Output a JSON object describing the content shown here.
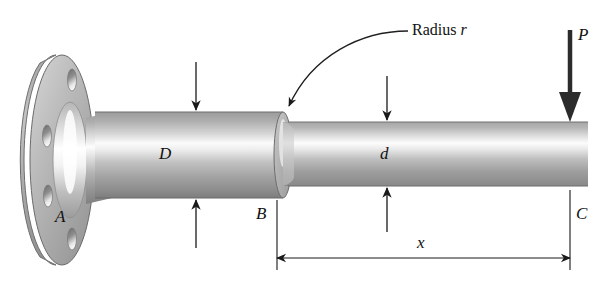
{
  "figure": {
    "background_color": "#ffffff",
    "line_color": "#1a1a1a",
    "metal_light": "#ffffff",
    "metal_mid": "#b9b9b9",
    "metal_dark": "#8d8d8d",
    "metal_shadow": "#6f6f6f"
  },
  "labels": {
    "point_a": "A",
    "point_b": "B",
    "point_c": "C",
    "large_diameter": "D",
    "small_diameter": "d",
    "load": "P",
    "distance": "x",
    "radius_word": "Radius",
    "radius_symbol": "r"
  },
  "annotations": {
    "radius_callout": "Radius r",
    "load_direction": "downward",
    "dimension_span": "B to C"
  },
  "geometry": {
    "flange_center_x": 62,
    "flange_center_y": 160,
    "flange_rx": 32,
    "flange_ry": 105,
    "flange_bolt_holes": 4,
    "large_shaft_left": 95,
    "large_shaft_right": 283,
    "large_shaft_top": 112,
    "large_shaft_bottom": 198,
    "small_shaft_left": 283,
    "small_shaft_right": 588,
    "small_shaft_top": 122,
    "small_shaft_bottom": 186,
    "dimension_line_y": 258,
    "dimension_left_x": 277,
    "dimension_right_x": 570
  }
}
